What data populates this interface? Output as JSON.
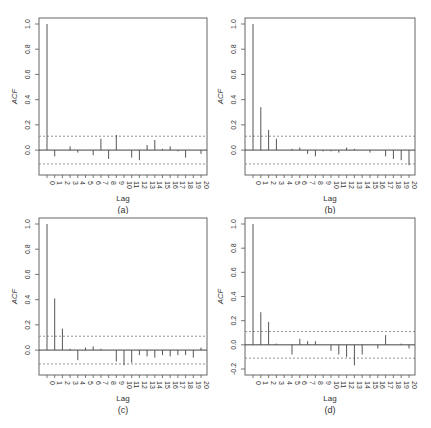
{
  "chart_data": [
    {
      "type": "bar",
      "panel": "(a)",
      "title": "",
      "xlabel": "Lag",
      "ylabel": "ACF",
      "ylim": [
        -0.15,
        1.0
      ],
      "yticks": [
        0.0,
        0.2,
        0.4,
        0.6,
        0.8,
        1.0
      ],
      "categories": [
        "0",
        "1",
        "2",
        "3",
        "4",
        "5",
        "6",
        "7",
        "8",
        "9",
        "10",
        "11",
        "12",
        "13",
        "14",
        "15",
        "16",
        "17",
        "18",
        "19",
        "20"
      ],
      "values": [
        1.0,
        -0.05,
        0.0,
        0.03,
        -0.02,
        0.0,
        -0.04,
        0.09,
        -0.07,
        0.12,
        0.0,
        -0.06,
        -0.08,
        0.04,
        0.08,
        0.01,
        0.03,
        -0.01,
        -0.06,
        0.0,
        -0.03
      ],
      "conf_band": 0.11,
      "grid": false
    },
    {
      "type": "bar",
      "panel": "(b)",
      "title": "",
      "xlabel": "Lag",
      "ylabel": "ACF",
      "ylim": [
        -0.15,
        1.0
      ],
      "yticks": [
        0.0,
        0.2,
        0.4,
        0.6,
        0.8,
        1.0
      ],
      "categories": [
        "0",
        "1",
        "2",
        "3",
        "4",
        "5",
        "6",
        "7",
        "8",
        "9",
        "10",
        "11",
        "12",
        "13",
        "14",
        "15",
        "16",
        "17",
        "18",
        "19",
        "20"
      ],
      "values": [
        1.0,
        0.34,
        0.16,
        0.09,
        0.0,
        0.01,
        0.02,
        -0.03,
        -0.05,
        -0.01,
        -0.01,
        -0.02,
        0.02,
        0.01,
        0.0,
        -0.02,
        0.0,
        -0.05,
        -0.07,
        -0.08,
        -0.12
      ],
      "conf_band": 0.11,
      "grid": false
    },
    {
      "type": "bar",
      "panel": "(c)",
      "title": "",
      "xlabel": "Lag",
      "ylabel": "ACF",
      "ylim": [
        -0.15,
        1.0
      ],
      "yticks": [
        0.0,
        0.2,
        0.4,
        0.6,
        0.8,
        1.0
      ],
      "categories": [
        "0",
        "1",
        "2",
        "3",
        "4",
        "5",
        "6",
        "7",
        "8",
        "9",
        "10",
        "11",
        "12",
        "13",
        "14",
        "15",
        "16",
        "17",
        "18",
        "19",
        "20"
      ],
      "values": [
        1.0,
        0.41,
        0.17,
        0.01,
        -0.08,
        0.02,
        0.03,
        0.01,
        0.0,
        -0.09,
        -0.12,
        -0.1,
        -0.04,
        -0.05,
        -0.06,
        -0.04,
        -0.05,
        -0.04,
        -0.04,
        -0.06,
        0.02
      ],
      "conf_band": 0.11,
      "grid": false
    },
    {
      "type": "bar",
      "panel": "(d)",
      "title": "",
      "xlabel": "Lag",
      "ylabel": "ACF",
      "ylim": [
        -0.2,
        1.0
      ],
      "yticks": [
        -0.2,
        0.0,
        0.2,
        0.4,
        0.6,
        0.8,
        1.0
      ],
      "categories": [
        "0",
        "1",
        "2",
        "3",
        "4",
        "5",
        "6",
        "7",
        "8",
        "9",
        "10",
        "11",
        "12",
        "13",
        "14",
        "15",
        "16",
        "17",
        "18",
        "19",
        "20"
      ],
      "values": [
        1.0,
        0.27,
        0.19,
        0.01,
        0.0,
        -0.08,
        0.05,
        0.03,
        0.03,
        0.0,
        -0.05,
        -0.08,
        -0.1,
        -0.17,
        -0.08,
        0.0,
        -0.03,
        0.08,
        0.0,
        0.01,
        -0.03
      ],
      "conf_band": 0.11,
      "grid": false
    }
  ],
  "panels": [
    {
      "label": "(a)"
    },
    {
      "label": "(b)"
    },
    {
      "label": "(c)"
    },
    {
      "label": "(d)"
    }
  ],
  "axis": {
    "xlabel": "Lag",
    "ylabel": "ACF"
  },
  "colors": {
    "bar": "#555555",
    "frame": "#666666",
    "band": "#777777"
  }
}
